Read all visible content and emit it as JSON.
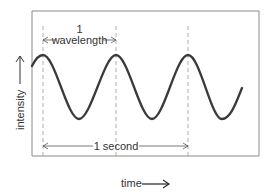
{
  "diagram": {
    "type": "sine-wave-frequency",
    "labels": {
      "wavelength_number": "1",
      "wavelength_text": "wavelength",
      "second": "1 second",
      "y_axis": "intensity",
      "x_axis": "time"
    },
    "colors": {
      "wave": "#3a3a3a",
      "frame": "#8a8a8a",
      "dashed": "#9a9a9a",
      "text": "#333333"
    },
    "cycles_per_second": 3
  }
}
